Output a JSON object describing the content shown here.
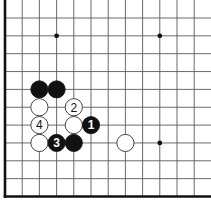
{
  "diagram": {
    "type": "go-board-fragment",
    "visible_edges": [
      "left",
      "bottom"
    ],
    "columns": 12,
    "rows": 11,
    "colors": {
      "black_stone": "#111111",
      "white_stone": "#ffffff",
      "grid_line": "#5a5a5a",
      "edge_line": "#111111"
    },
    "hoshi": [
      {
        "col": 3,
        "row": 1
      },
      {
        "col": 9,
        "row": 1
      },
      {
        "col": 9,
        "row": 7
      }
    ],
    "stones": [
      {
        "color": "black",
        "col": 2,
        "row": 4,
        "label": ""
      },
      {
        "color": "black",
        "col": 3,
        "row": 4,
        "label": ""
      },
      {
        "color": "white",
        "col": 2,
        "row": 5,
        "label": ""
      },
      {
        "color": "white",
        "col": 4,
        "row": 5,
        "label": "2"
      },
      {
        "color": "white",
        "col": 2,
        "row": 6,
        "label": "4"
      },
      {
        "color": "white",
        "col": 4,
        "row": 6,
        "label": ""
      },
      {
        "color": "black",
        "col": 5,
        "row": 6,
        "label": "1"
      },
      {
        "color": "white",
        "col": 2,
        "row": 7,
        "label": ""
      },
      {
        "color": "black",
        "col": 3,
        "row": 7,
        "label": "3"
      },
      {
        "color": "black",
        "col": 4,
        "row": 7,
        "label": ""
      },
      {
        "color": "white",
        "col": 7,
        "row": 7,
        "label": ""
      }
    ]
  }
}
